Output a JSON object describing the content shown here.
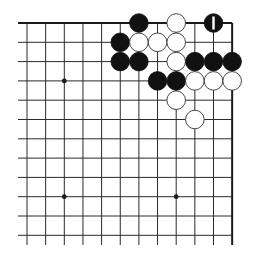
{
  "board": {
    "view": "top-right corner",
    "columns_visible": 12,
    "rows_visible": 12,
    "origin_x": 27,
    "origin_y": 23,
    "spacing_x": 18.65,
    "spacing_y": 19.3,
    "left_extent": 18,
    "bottom_extent": 245,
    "top_edge": true,
    "right_edge": true,
    "colors": {
      "line": "#2a2a2a",
      "black_stone": "#111111",
      "white_stone": "#ffffff",
      "white_outline": "#333333",
      "background": "#ffffff"
    }
  },
  "star_points": [
    {
      "col": 2,
      "row": 3
    },
    {
      "col": 2,
      "row": 9
    },
    {
      "col": 8,
      "row": 9
    }
  ],
  "stones": [
    {
      "color": "black",
      "col": 6,
      "row": 0
    },
    {
      "color": "white",
      "col": 8,
      "row": 0
    },
    {
      "color": "black",
      "col": 10,
      "row": 0,
      "marker": "1"
    },
    {
      "color": "black",
      "col": 5,
      "row": 1
    },
    {
      "color": "white",
      "col": 6,
      "row": 1
    },
    {
      "color": "white",
      "col": 7,
      "row": 1
    },
    {
      "color": "white",
      "col": 8,
      "row": 1
    },
    {
      "color": "black",
      "col": 5,
      "row": 2
    },
    {
      "color": "black",
      "col": 6,
      "row": 2
    },
    {
      "color": "white",
      "col": 8,
      "row": 2
    },
    {
      "color": "black",
      "col": 9,
      "row": 2
    },
    {
      "color": "black",
      "col": 10,
      "row": 2
    },
    {
      "color": "black",
      "col": 11,
      "row": 2
    },
    {
      "color": "black",
      "col": 7,
      "row": 3
    },
    {
      "color": "black",
      "col": 8,
      "row": 3
    },
    {
      "color": "white",
      "col": 9,
      "row": 3
    },
    {
      "color": "white",
      "col": 10,
      "row": 3
    },
    {
      "color": "white",
      "col": 11,
      "row": 3
    },
    {
      "color": "white",
      "col": 8,
      "row": 4
    },
    {
      "color": "white",
      "col": 9,
      "row": 5
    }
  ]
}
